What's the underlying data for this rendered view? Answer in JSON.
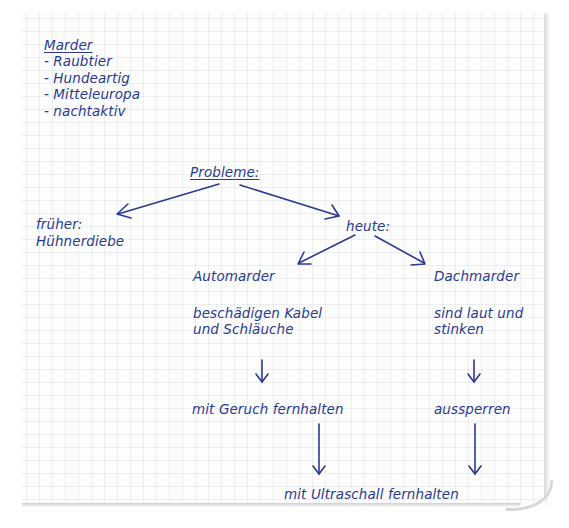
{
  "note": {
    "heading": "Marder",
    "traits": [
      "- Raubtier",
      "- Hundeartig",
      "- Mitteleuropa",
      "- nachtaktiv"
    ]
  },
  "diagram": {
    "root": "Probleme:",
    "past": {
      "label": "früher:",
      "detail": "Hühnerdiebe"
    },
    "present": {
      "label": "heute:",
      "branches": [
        {
          "name": "Automarder",
          "problem_lines": [
            "beschädigen Kabel",
            "und Schläuche"
          ],
          "solution": "mit Geruch fernhalten"
        },
        {
          "name": "Dachmarder",
          "problem_lines": [
            "sind laut und",
            "stinken"
          ],
          "solution": "aussperren"
        }
      ],
      "shared_solution": "mit Ultraschall fernhalten"
    }
  },
  "style": {
    "ink_color": "#2b3a8f",
    "paper_grid": "squared"
  }
}
